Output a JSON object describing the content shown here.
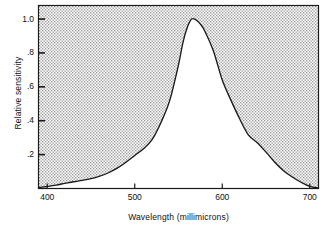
{
  "chart_data": {
    "type": "area",
    "title": "",
    "xlabel": "Wavelength (millimicrons)",
    "ylabel": "Relative sensitivity",
    "xlim": [
      390,
      710
    ],
    "ylim": [
      0,
      1.08
    ],
    "xticks": [
      400,
      500,
      600,
      700
    ],
    "xtick_labels": [
      "400",
      "500",
      "600",
      "700"
    ],
    "yticks": [
      0.2,
      0.4,
      0.6,
      0.8,
      1.0
    ],
    "ytick_labels": [
      ".2",
      ".4",
      ".6",
      ".8",
      "1.0"
    ],
    "grid": false,
    "legend": null,
    "fill": "above-curve-shaded-halftone",
    "series": [
      {
        "name": "Relative sensitivity",
        "x": [
          390,
          400,
          410,
          420,
          430,
          440,
          450,
          460,
          470,
          480,
          490,
          500,
          510,
          520,
          530,
          540,
          550,
          555,
          560,
          565,
          570,
          575,
          580,
          590,
          600,
          610,
          620,
          630,
          640,
          650,
          660,
          670,
          680,
          690,
          700,
          710
        ],
        "values": [
          0.005,
          0.012,
          0.02,
          0.03,
          0.04,
          0.048,
          0.058,
          0.073,
          0.093,
          0.12,
          0.155,
          0.195,
          0.235,
          0.29,
          0.39,
          0.52,
          0.73,
          0.86,
          0.95,
          1.0,
          0.995,
          0.97,
          0.93,
          0.81,
          0.64,
          0.52,
          0.41,
          0.315,
          0.27,
          0.215,
          0.155,
          0.105,
          0.068,
          0.037,
          0.012,
          0.003
        ]
      }
    ],
    "peak": {
      "x": 565,
      "y": 1.0
    }
  },
  "figure": {
    "axis_line_color": "#1a1a1a",
    "curve_color": "#1a1a1a",
    "shade_color": "#c9c9c9",
    "background": "#ffffff"
  }
}
